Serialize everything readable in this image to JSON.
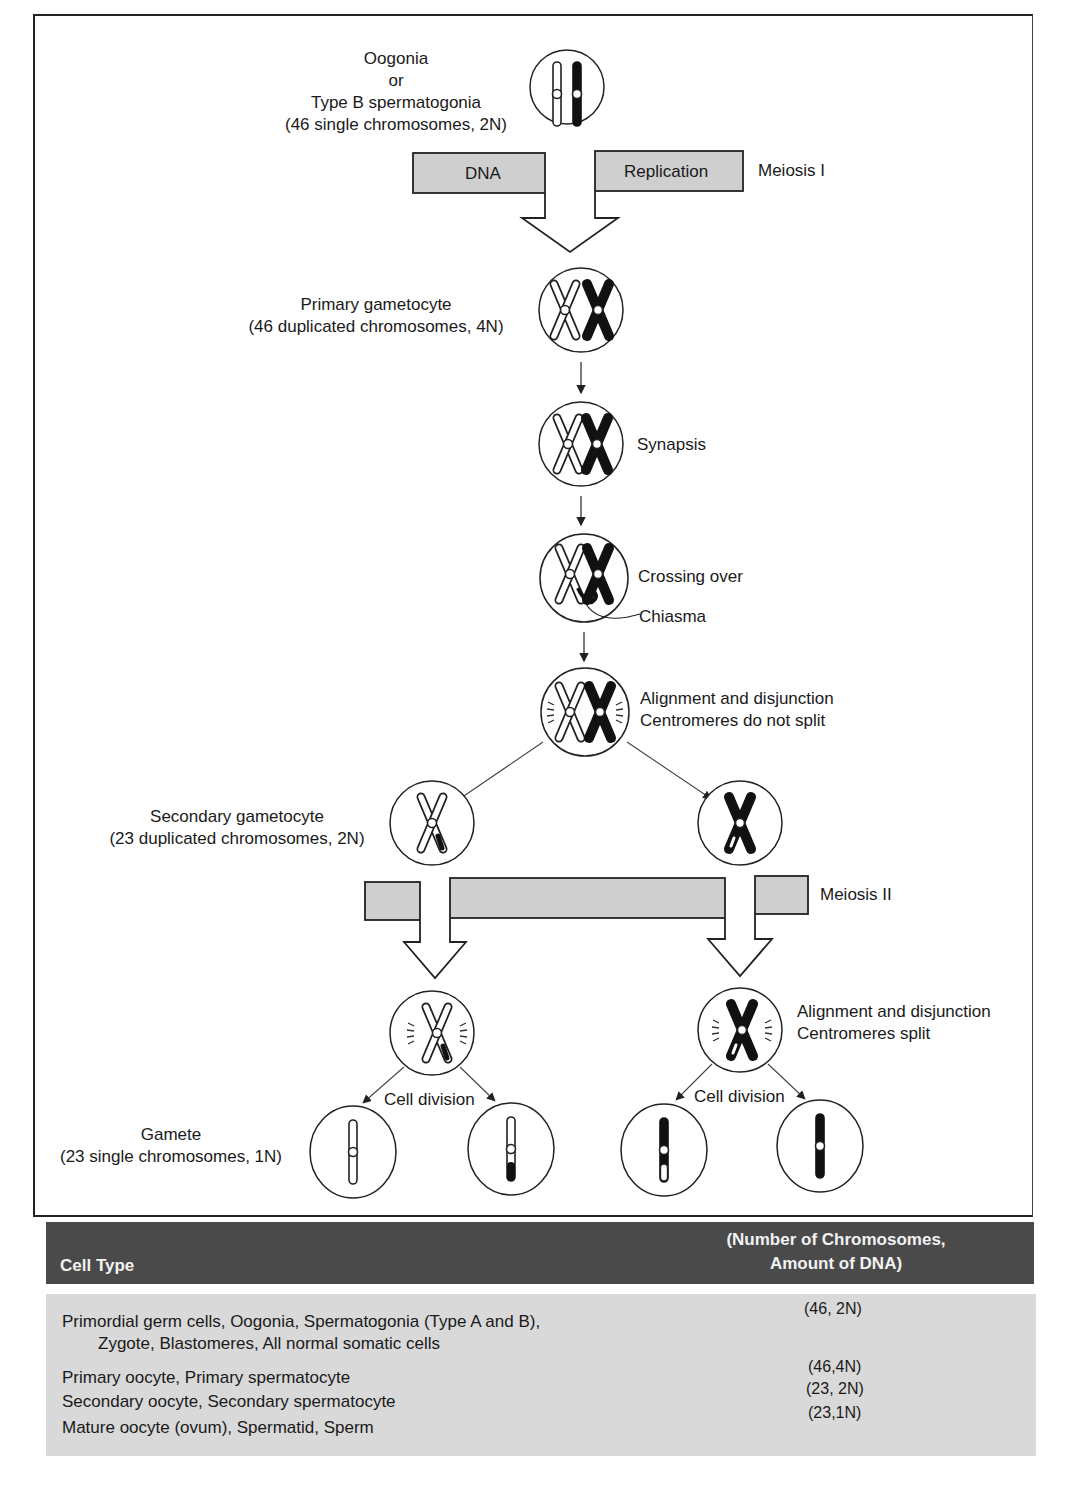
{
  "diagram": {
    "type": "meiosis-flowchart",
    "stages": {
      "oogonia": {
        "line1": "Oogonia",
        "line2": "or",
        "line3": "Type B spermatogonia",
        "line4": "(46 single chromosomes, 2N)"
      },
      "replication_bar": {
        "left_label": "DNA",
        "right_label": "Replication",
        "phase_label": "Meiosis I"
      },
      "primary": {
        "line1": "Primary gametocyte",
        "line2": "(46 duplicated chromosomes, 4N)"
      },
      "synapsis": {
        "label": "Synapsis"
      },
      "crossing_over": {
        "label": "Crossing over",
        "pointer_label": "Chiasma"
      },
      "alignment1": {
        "line1": "Alignment and disjunction",
        "line2": "Centromeres do not split"
      },
      "secondary": {
        "line1": "Secondary gametocyte",
        "line2": "(23 duplicated chromosomes, 2N)"
      },
      "meiosis2_bar": {
        "phase_label": "Meiosis II"
      },
      "alignment2": {
        "line1": "Alignment and disjunction",
        "line2": "Centromeres split"
      },
      "cell_division": {
        "left_label": "Cell division",
        "right_label": "Cell division"
      },
      "gamete": {
        "line1": "Gamete",
        "line2": "(23 single chromosomes, 1N)"
      }
    },
    "colors": {
      "bar_fill": "#cfcfcf",
      "outline": "#222222",
      "table_header_bg": "#4a4a4a",
      "table_body_bg": "#d9d9d9"
    }
  },
  "table": {
    "headers": {
      "cell_type": "Cell Type",
      "dna_line1": "(Number of Chromosomes,",
      "dna_line2": "Amount of DNA)"
    },
    "rows": [
      {
        "cell_type_line1": "Primordial germ cells, Oogonia, Spermatogonia (Type A and B),",
        "cell_type_line2": "Zygote, Blastomeres, All normal somatic cells",
        "value": "(46, 2N)"
      },
      {
        "cell_type_line1": "Primary oocyte, Primary spermatocyte",
        "value": "(46,4N)"
      },
      {
        "cell_type_line1": "Secondary oocyte, Secondary spermatocyte",
        "value": "(23, 2N)"
      },
      {
        "cell_type_line1": "Mature oocyte (ovum), Spermatid, Sperm",
        "value": "(23,1N)"
      }
    ]
  }
}
